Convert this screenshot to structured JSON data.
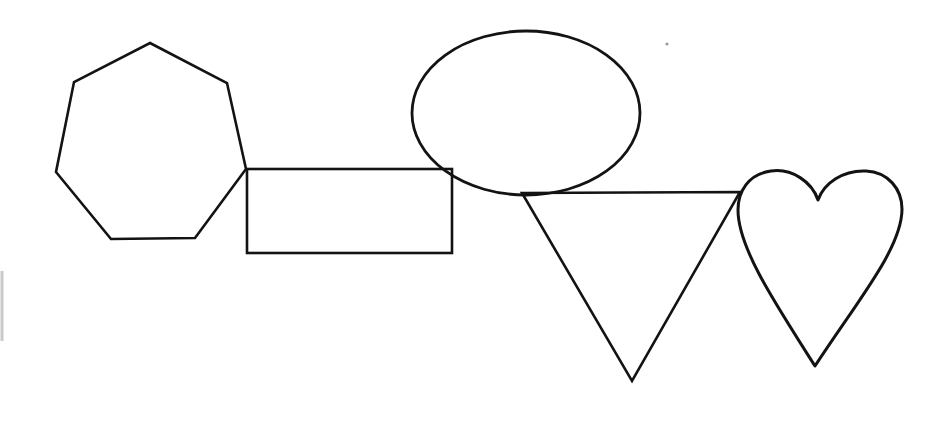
{
  "canvas": {
    "width": 949,
    "height": 437,
    "background_color": "#ffffff",
    "stroke_color": "#131313",
    "title": "Overlapping geometric line shapes"
  },
  "shapes": [
    {
      "id": "heptagon",
      "name": "heptagon",
      "label": "Heptagon",
      "stroke_width": 2.6,
      "points": "150,43 227,83 246,169 195,238 111,239 56,172 74,82"
    },
    {
      "id": "rectangle",
      "name": "rectangle",
      "label": "Rectangle",
      "stroke_width": 2.6,
      "x": 247,
      "y": 169,
      "width": 205,
      "height": 84
    },
    {
      "id": "ellipse",
      "name": "ellipse",
      "label": "Ellipse",
      "stroke_width": 2.8,
      "cx": 526,
      "cy": 113,
      "rx": 114,
      "ry": 82
    },
    {
      "id": "triangle",
      "name": "triangle",
      "label": "Inverted triangle",
      "stroke_width": 2.6,
      "points": "522,193 740,192 632,381"
    },
    {
      "id": "heart",
      "name": "heart",
      "label": "Heart",
      "stroke_width": 3.0,
      "path": "M 818,200 C 812,182 792,168 771,171 C 748,174 738,192 738,210 C 738,247 773,300 815,366 C 858,300 902,248 902,209 C 902,189 888,172 866,171 C 843,170 824,183 818,200 Z"
    }
  ],
  "marks": [
    {
      "id": "left-edge-mark",
      "name": "left-edge-scan-artifact",
      "label": "Faint vertical edge artifact",
      "color": "#c9c9c9",
      "x1": 2,
      "y1": 271,
      "x2": 2,
      "y2": 341,
      "stroke_width": 3
    },
    {
      "id": "speck",
      "name": "dust-speck",
      "label": "Small dust speck",
      "color": "#9a9a9a",
      "cx": 667,
      "cy": 44,
      "r": 1.6
    }
  ]
}
